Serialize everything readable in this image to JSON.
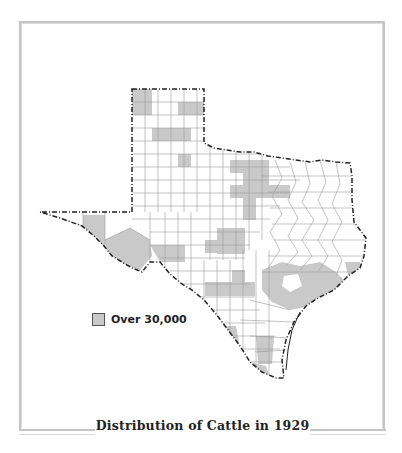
{
  "title": "Distribution of Cattle in 1929",
  "legend": {
    "label": "Over 30,000",
    "swatch_color": "#c9c9c9"
  },
  "map": {
    "region": "Texas",
    "unit": "counties",
    "shading_meaning": "Counties with over 30,000 cattle",
    "colors": {
      "shaded": "#c9c9c9",
      "boundary": "#222222",
      "county_lines": "#9a9a9a",
      "background": "#ffffff"
    }
  }
}
